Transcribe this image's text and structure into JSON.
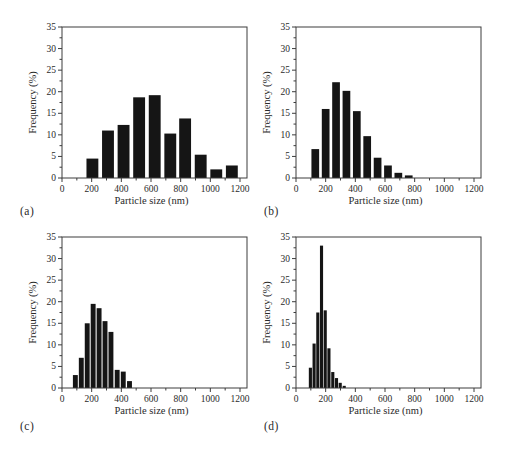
{
  "figure": {
    "background": "#ffffff",
    "bar_color": "#151515",
    "axis_color": "#3c3c3c",
    "text_color": "#2a2a2a"
  },
  "chart_data": [
    {
      "type": "bar",
      "panel_label": "(a)",
      "title": "",
      "xlabel": "Particle size (nm)",
      "ylabel": "Frequency (%)",
      "xlim": [
        0,
        1200
      ],
      "ylim": [
        0,
        35
      ],
      "xticks": [
        0,
        200,
        400,
        600,
        800,
        1000,
        1200
      ],
      "yticks": [
        0,
        5,
        10,
        15,
        20,
        25,
        30,
        35
      ],
      "minor_x_step": 100,
      "minor_y_step": 2.5,
      "grid": "off",
      "bar_width_nm": 80,
      "x": [
        205,
        310,
        415,
        520,
        625,
        730,
        830,
        935,
        1040,
        1145
      ],
      "values": [
        4.5,
        11.0,
        12.3,
        18.7,
        19.2,
        10.3,
        13.8,
        5.4,
        2.0,
        2.9
      ]
    },
    {
      "type": "bar",
      "panel_label": "(b)",
      "title": "",
      "xlabel": "Particle size (nm)",
      "ylabel": "Frequency (%)",
      "xlim": [
        0,
        1200
      ],
      "ylim": [
        0,
        35
      ],
      "xticks": [
        0,
        200,
        400,
        600,
        800,
        1000,
        1200
      ],
      "yticks": [
        0,
        5,
        10,
        15,
        20,
        25,
        30,
        35
      ],
      "minor_x_step": 100,
      "minor_y_step": 2.5,
      "grid": "off",
      "bar_width_nm": 52,
      "x": [
        130,
        200,
        270,
        340,
        410,
        480,
        550,
        620,
        690,
        760
      ],
      "values": [
        6.7,
        16.0,
        22.2,
        20.2,
        15.5,
        9.7,
        4.7,
        2.9,
        1.2,
        0.6
      ]
    },
    {
      "type": "bar",
      "panel_label": "(c)",
      "title": "",
      "xlabel": "Particle size (nm)",
      "ylabel": "Frequency (%)",
      "xlim": [
        0,
        1200
      ],
      "ylim": [
        0,
        35
      ],
      "xticks": [
        0,
        200,
        400,
        600,
        800,
        1000,
        1200
      ],
      "yticks": [
        0,
        5,
        10,
        15,
        20,
        25,
        30,
        35
      ],
      "minor_x_step": 100,
      "minor_y_step": 2.5,
      "grid": "off",
      "bar_width_nm": 33,
      "x": [
        90,
        130,
        170,
        210,
        250,
        290,
        330,
        372,
        413,
        455
      ],
      "values": [
        3.0,
        7.0,
        15.0,
        19.5,
        18.5,
        15.5,
        13.0,
        4.2,
        3.8,
        1.6
      ]
    },
    {
      "type": "bar",
      "panel_label": "(d)",
      "title": "",
      "xlabel": "Particle size (nm)",
      "ylabel": "Frequency (%)",
      "xlim": [
        0,
        1200
      ],
      "ylim": [
        0,
        35
      ],
      "xticks": [
        0,
        200,
        400,
        600,
        800,
        1000,
        1200
      ],
      "yticks": [
        0,
        5,
        10,
        15,
        20,
        25,
        30,
        35
      ],
      "minor_x_step": 100,
      "minor_y_step": 2.5,
      "grid": "off",
      "bar_width_nm": 21,
      "x": [
        97,
        122,
        147,
        172,
        197,
        222,
        248,
        273,
        298,
        325
      ],
      "values": [
        4.7,
        10.3,
        17.5,
        33.0,
        18.0,
        9.2,
        3.7,
        2.3,
        1.2,
        0.5
      ]
    }
  ]
}
